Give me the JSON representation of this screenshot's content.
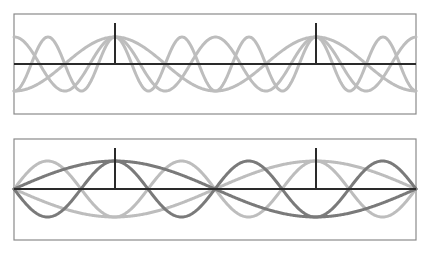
{
  "colors": {
    "frame": "#8a8a8a",
    "axis": "#2a2a2a",
    "marker": "#2a2a2a",
    "light_wave": "#bdbdbd",
    "dark_wave": "#7a7a7a"
  },
  "panels": [
    {
      "name": "top-panel-cosine-modes",
      "box": {
        "x": 14,
        "y": 14,
        "width": 402,
        "height": 100
      },
      "axis_y": 64,
      "amplitude": 27,
      "markers": [
        {
          "x": 115,
          "y_top": 23
        },
        {
          "x": 316,
          "y_top": 23
        }
      ],
      "waves": [
        {
          "type": "cos",
          "k": 1,
          "origin_x": 115,
          "period": 201,
          "sign": 1,
          "shade": "light"
        },
        {
          "type": "cos",
          "k": 2,
          "origin_x": 115,
          "period": 201,
          "sign": 1,
          "shade": "light"
        },
        {
          "type": "cos",
          "k": 3,
          "origin_x": 115,
          "period": 201,
          "sign": 1,
          "shade": "light"
        }
      ]
    },
    {
      "name": "bottom-panel-sine-modes",
      "box": {
        "x": 14,
        "y": 139,
        "width": 402,
        "height": 101
      },
      "axis_y": 189,
      "amplitude": 28,
      "markers": [
        {
          "x": 115,
          "y_top": 148
        },
        {
          "x": 316,
          "y_top": 148
        }
      ],
      "waves": [
        {
          "type": "sin",
          "k": 1,
          "origin_x": 14,
          "half_period": 201,
          "sign": -1,
          "shade": "light"
        },
        {
          "type": "sin",
          "k": 3,
          "origin_x": 14,
          "half_period": 201,
          "sign": 1,
          "shade": "light"
        },
        {
          "type": "sin",
          "k": 1,
          "origin_x": 14,
          "half_period": 201,
          "sign": 1,
          "shade": "dark"
        },
        {
          "type": "sin",
          "k": 3,
          "origin_x": 14,
          "half_period": 201,
          "sign": -1,
          "shade": "dark"
        }
      ]
    }
  ]
}
